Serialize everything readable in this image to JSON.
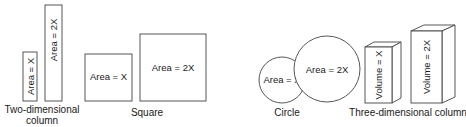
{
  "diagram": {
    "groups": [
      {
        "id": "two-dimensional-column",
        "caption_line1": "Two-dimensional",
        "caption_line2": "column",
        "shapes": [
          {
            "label": "Area = X"
          },
          {
            "label": "Area = 2X"
          }
        ]
      },
      {
        "id": "square",
        "caption": "Square",
        "shapes": [
          {
            "label": "Area = X"
          },
          {
            "label": "Area = 2X"
          }
        ]
      },
      {
        "id": "circle",
        "caption": "Circle",
        "shapes": [
          {
            "label": "Area = X"
          },
          {
            "label": "Area = 2X"
          }
        ]
      },
      {
        "id": "three-dimensional-column",
        "caption": "Three-dimensional column",
        "shapes": [
          {
            "label": "Volume = X"
          },
          {
            "label": "Volume = 2X"
          }
        ]
      }
    ],
    "colors": {
      "stroke": "#444444",
      "text": "#1a1a1a",
      "background": "#ffffff"
    }
  }
}
